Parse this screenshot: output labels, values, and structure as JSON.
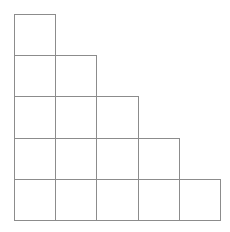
{
  "diagram": {
    "type": "staircase-grid",
    "rows": [
      1,
      2,
      3,
      4,
      5
    ],
    "origin": [
      14,
      14
    ],
    "cell_size": 41.2,
    "line_color": "#8c8c8c",
    "background": "#ffffff"
  }
}
